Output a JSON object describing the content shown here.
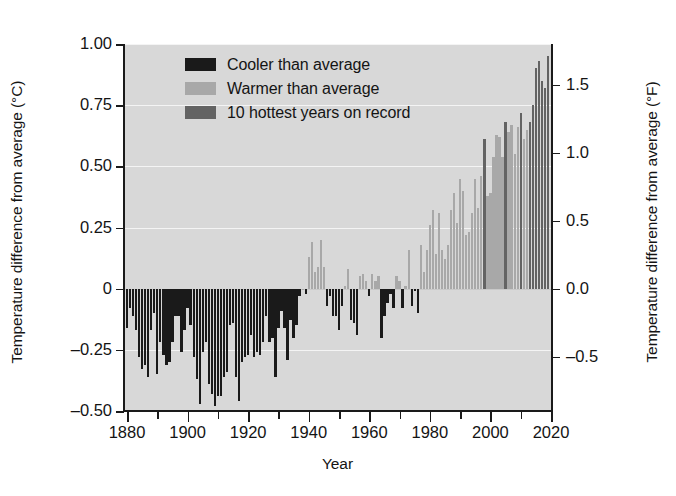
{
  "chart_data": {
    "type": "bar",
    "title": "",
    "xlabel": "Year",
    "ylabel": "Temperature difference from average (°C)",
    "ylabel_right": "Temperature difference from average (°F)",
    "xlim": [
      1879,
      2020
    ],
    "ylim": [
      -0.5,
      1.0
    ],
    "ylim_right": [
      -0.9,
      1.8
    ],
    "grid": true,
    "legend_position": "upper-left-inside",
    "x_tick_labels": [
      "1880",
      "1900",
      "1920",
      "1940",
      "1960",
      "1980",
      "2000",
      "2020"
    ],
    "x_tick_values": [
      1880,
      1900,
      1920,
      1940,
      1960,
      1980,
      2000,
      2020
    ],
    "x_minor_ticks": [
      1890,
      1910,
      1930,
      1950,
      1970,
      1990,
      2010
    ],
    "y_tick_labels": [
      "1.00",
      "0.75",
      "0.50",
      "0.25",
      "0",
      "–0.25",
      "–0.50"
    ],
    "y_tick_values": [
      1.0,
      0.75,
      0.5,
      0.25,
      0,
      -0.25,
      -0.5
    ],
    "y_tick_labels_right": [
      "1.5",
      "1.0",
      "0.5",
      "0.0",
      "–0.5"
    ],
    "y_tick_values_right": [
      1.5,
      1.0,
      0.5,
      0.0,
      -0.5
    ],
    "legend": [
      {
        "label": "Cooler than average",
        "color": "#1a1a1a"
      },
      {
        "label": "Warmer than average",
        "color": "#a8a8a8"
      },
      {
        "label": "10 hottest years on record",
        "color": "#636363"
      }
    ],
    "colors": {
      "cooler": "#1a1a1a",
      "warmer": "#a8a8a8",
      "hottest": "#636363",
      "plot_background": "#d8d8d8",
      "gridline": "#f4f4f4",
      "axis": "#1a1a1a"
    },
    "hottest_years": [
      1998,
      2005,
      2010,
      2014,
      2015,
      2016,
      2017,
      2018,
      2019,
      2013
    ],
    "categories": [
      1880,
      1881,
      1882,
      1883,
      1884,
      1885,
      1886,
      1887,
      1888,
      1889,
      1890,
      1891,
      1892,
      1893,
      1894,
      1895,
      1896,
      1897,
      1898,
      1899,
      1900,
      1901,
      1902,
      1903,
      1904,
      1905,
      1906,
      1907,
      1908,
      1909,
      1910,
      1911,
      1912,
      1913,
      1914,
      1915,
      1916,
      1917,
      1918,
      1919,
      1920,
      1921,
      1922,
      1923,
      1924,
      1925,
      1926,
      1927,
      1928,
      1929,
      1930,
      1931,
      1932,
      1933,
      1934,
      1935,
      1936,
      1937,
      1938,
      1939,
      1940,
      1941,
      1942,
      1943,
      1944,
      1945,
      1946,
      1947,
      1948,
      1949,
      1950,
      1951,
      1952,
      1953,
      1954,
      1955,
      1956,
      1957,
      1958,
      1959,
      1960,
      1961,
      1962,
      1963,
      1964,
      1965,
      1966,
      1967,
      1968,
      1969,
      1970,
      1971,
      1972,
      1973,
      1974,
      1975,
      1976,
      1977,
      1978,
      1979,
      1980,
      1981,
      1982,
      1983,
      1984,
      1985,
      1986,
      1987,
      1988,
      1989,
      1990,
      1991,
      1992,
      1993,
      1994,
      1995,
      1996,
      1997,
      1998,
      1999,
      2000,
      2001,
      2002,
      2003,
      2004,
      2005,
      2006,
      2007,
      2008,
      2009,
      2010,
      2011,
      2012,
      2013,
      2014,
      2015,
      2016,
      2017,
      2018,
      2019
    ],
    "values": [
      -0.16,
      -0.08,
      -0.11,
      -0.17,
      -0.28,
      -0.33,
      -0.31,
      -0.36,
      -0.17,
      -0.1,
      -0.35,
      -0.22,
      -0.27,
      -0.31,
      -0.3,
      -0.22,
      -0.11,
      -0.11,
      -0.26,
      -0.17,
      -0.08,
      -0.15,
      -0.28,
      -0.37,
      -0.47,
      -0.26,
      -0.22,
      -0.39,
      -0.43,
      -0.48,
      -0.44,
      -0.44,
      -0.36,
      -0.34,
      -0.15,
      -0.14,
      -0.36,
      -0.46,
      -0.3,
      -0.28,
      -0.27,
      -0.19,
      -0.28,
      -0.26,
      -0.27,
      -0.22,
      -0.11,
      -0.22,
      -0.2,
      -0.36,
      -0.16,
      -0.09,
      -0.16,
      -0.29,
      -0.13,
      -0.2,
      -0.15,
      -0.03,
      0.0,
      -0.02,
      0.13,
      0.19,
      0.07,
      0.09,
      0.2,
      0.09,
      -0.07,
      -0.03,
      -0.11,
      -0.11,
      -0.17,
      -0.07,
      0.01,
      0.08,
      -0.13,
      -0.14,
      -0.19,
      0.05,
      0.06,
      0.03,
      -0.03,
      0.06,
      0.03,
      0.05,
      -0.2,
      -0.11,
      -0.06,
      -0.02,
      -0.08,
      0.05,
      0.03,
      -0.08,
      0.01,
      0.16,
      -0.07,
      -0.01,
      -0.1,
      0.18,
      0.07,
      0.16,
      0.26,
      0.32,
      0.14,
      0.31,
      0.16,
      0.12,
      0.18,
      0.32,
      0.39,
      0.27,
      0.45,
      0.4,
      0.22,
      0.23,
      0.31,
      0.45,
      0.33,
      0.46,
      0.61,
      0.38,
      0.39,
      0.54,
      0.63,
      0.62,
      0.54,
      0.68,
      0.64,
      0.67,
      0.55,
      0.66,
      0.72,
      0.61,
      0.65,
      0.68,
      0.75,
      0.9,
      0.93,
      0.85,
      0.82,
      0.95
    ]
  }
}
